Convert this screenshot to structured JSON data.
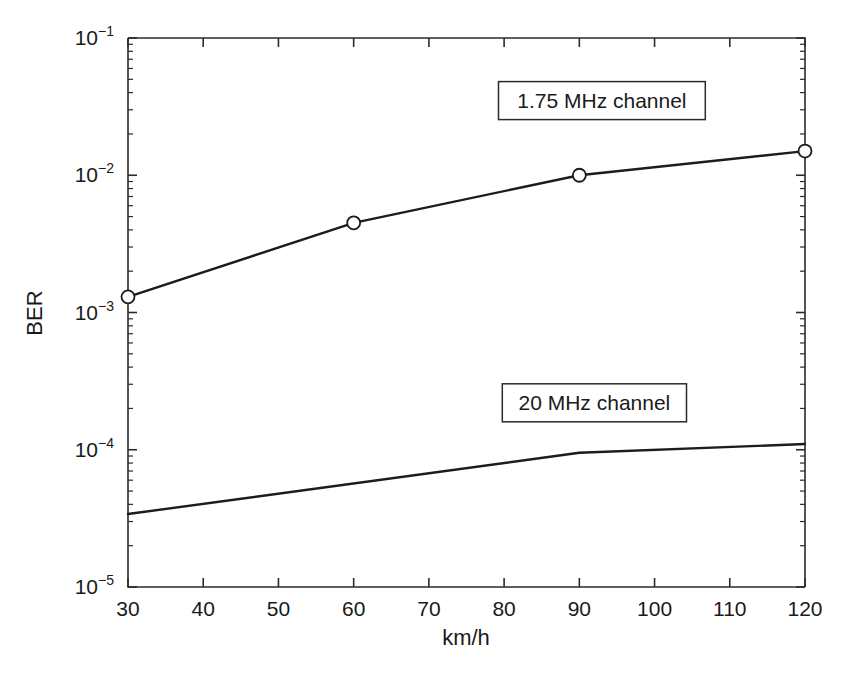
{
  "chart_data": {
    "type": "line",
    "title": "",
    "xlabel": "km/h",
    "ylabel": "BER",
    "xlim": [
      30,
      120
    ],
    "ylim": [
      1e-05,
      0.1
    ],
    "yscale": "log",
    "xscale": "linear",
    "grid": false,
    "legend_position": "inline-annotations",
    "x_ticks": [
      30,
      40,
      50,
      60,
      70,
      80,
      90,
      100,
      110,
      120
    ],
    "x_tick_labels": [
      "30",
      "40",
      "50",
      "60",
      "70",
      "80",
      "90",
      "100",
      "110",
      "120"
    ],
    "y_ticks": [
      1e-05,
      0.0001,
      0.001,
      0.01,
      0.1
    ],
    "y_tick_labels": [
      "10-5",
      "10-4",
      "10-3",
      "10-2",
      "10-1"
    ],
    "y_tick_mantissa": [
      "10",
      "10",
      "10",
      "10",
      "10"
    ],
    "y_tick_exponents": [
      "−5",
      "−4",
      "−3",
      "−2",
      "−1"
    ],
    "series": [
      {
        "name": "1.75 MHz channel",
        "marker": "circle",
        "x": [
          30,
          60,
          90,
          120
        ],
        "values": [
          0.0013,
          0.0045,
          0.01,
          0.015
        ]
      },
      {
        "name": "20 MHz channel",
        "marker": "none",
        "x": [
          30,
          90,
          120
        ],
        "values": [
          3.4e-05,
          9.5e-05,
          0.00011
        ]
      }
    ],
    "annotations": [
      {
        "text": "1.75 MHz channel",
        "x": 93,
        "y": 0.035
      },
      {
        "text": "20 MHz channel",
        "x": 92,
        "y": 0.00022
      }
    ]
  },
  "axes": {
    "y_axis_title": "BER",
    "x_axis_title": "km/h"
  }
}
